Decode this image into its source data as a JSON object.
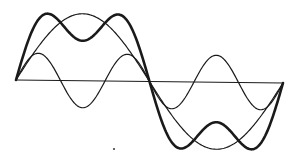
{
  "diagram": {
    "colors": {
      "stroke": "#1a1a1a",
      "background": "#ffffff"
    },
    "axis": {
      "x0": 16,
      "y0": 80,
      "x1": 283,
      "y1": 83
    },
    "period": {
      "start_x": 16,
      "end_x": 283
    },
    "curves": [
      {
        "name": "fundamental",
        "harmonic": 1,
        "amplitude_px": 67,
        "stroke_width": 1.2
      },
      {
        "name": "third-harmonic",
        "harmonic": 3,
        "amplitude_px": 27,
        "stroke_width": 1.2
      },
      {
        "name": "sum",
        "harmonic": "1+3",
        "amplitude_px": null,
        "stroke_width": 2.6
      }
    ],
    "stray_mark": {
      "x": 114,
      "y": 149
    }
  }
}
